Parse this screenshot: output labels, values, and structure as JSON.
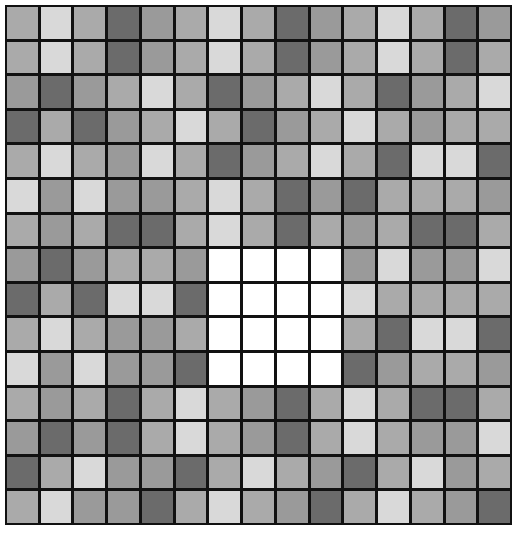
{
  "board": {
    "columns": 15,
    "rows": 15,
    "palette": {
      "W": "#ffffff",
      "L": "#d9d9d9",
      "M": "#aaaaaa",
      "G": "#9a9a9a",
      "D": "#6b6b6b"
    },
    "gridline_color": "#111111",
    "cells": [
      "MLMDGMLMDGMLMDG",
      "MLMDGMLMDGMLMDM",
      "GDGMLMDGMLMDGML",
      "DMDGMLMDGMLMGMM",
      "MLMGLMDGMLMDLLD",
      "LGLGGMLMDGDMMMG",
      "MGMDDMLMDMGMDDM",
      "GDGMMGWWWWGLGGL",
      "DMDLLDWWWWLMMMM",
      "MLMGGMWWWWMDLLD",
      "LGLGGDWWWWDGMMG",
      "MGMDMLMGDMLMDDM",
      "GDGDMLMGDMLMGGL",
      "DMLGGDMLMGDMLGM",
      "MLGGDMLMGDMLMGD"
    ]
  }
}
